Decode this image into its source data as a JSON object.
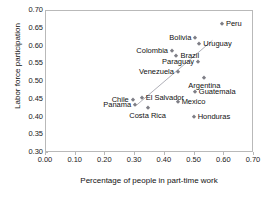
{
  "chart_data": {
    "type": "scatter",
    "title": "",
    "xlabel": "Percentage of people in part-time work",
    "ylabel": "Labor force participation",
    "xlim": [
      0.0,
      0.7
    ],
    "ylim": [
      0.3,
      0.7
    ],
    "xticks": [
      "0.00",
      "0.10",
      "0.20",
      "0.30",
      "0.40",
      "0.50",
      "0.60",
      "0.70"
    ],
    "xtick_values": [
      0.0,
      0.1,
      0.2,
      0.3,
      0.4,
      0.5,
      0.6,
      0.7
    ],
    "yticks": [
      "0.70",
      "0.65",
      "0.60",
      "0.55",
      "0.50",
      "0.45",
      "0.40",
      "0.35",
      "0.30"
    ],
    "ytick_values": [
      0.7,
      0.65,
      0.6,
      0.55,
      0.5,
      0.45,
      0.4,
      0.35,
      0.3
    ],
    "grid": false,
    "legend": "none",
    "marker_color": "#7e7e86",
    "marker_shape": "diamond",
    "trendline": {
      "visible": true,
      "color": "#b0b0b8",
      "x": [
        0.305,
        0.56
      ],
      "y": [
        0.435,
        0.617
      ]
    },
    "points": [
      {
        "label": "Peru",
        "x": 0.592,
        "y": 0.663,
        "label_pos": "right"
      },
      {
        "label": "Bolivia",
        "x": 0.503,
        "y": 0.625,
        "label_pos": "left"
      },
      {
        "label": "Uruguay",
        "x": 0.516,
        "y": 0.606,
        "label_pos": "right"
      },
      {
        "label": "Colombia",
        "x": 0.424,
        "y": 0.587,
        "label_pos": "left"
      },
      {
        "label": "Brazil",
        "x": 0.439,
        "y": 0.574,
        "label_pos": "right"
      },
      {
        "label": "Paraguay",
        "x": 0.512,
        "y": 0.556,
        "label_pos": "left"
      },
      {
        "label": "Venezuela",
        "x": 0.444,
        "y": 0.527,
        "label_pos": "left"
      },
      {
        "label": "Argentina",
        "x": 0.533,
        "y": 0.512,
        "label_pos": "below"
      },
      {
        "label": "Guatemala",
        "x": 0.501,
        "y": 0.471,
        "label_pos": "right"
      },
      {
        "label": "El Salvador",
        "x": 0.322,
        "y": 0.456,
        "label_pos": "right"
      },
      {
        "label": "Chile",
        "x": 0.292,
        "y": 0.45,
        "label_pos": "left"
      },
      {
        "label": "Mexico",
        "x": 0.443,
        "y": 0.444,
        "label_pos": "right"
      },
      {
        "label": "Panama",
        "x": 0.3,
        "y": 0.434,
        "label_pos": "left"
      },
      {
        "label": "Costa Rica",
        "x": 0.342,
        "y": 0.427,
        "label_pos": "below"
      },
      {
        "label": "Honduras",
        "x": 0.497,
        "y": 0.401,
        "label_pos": "right"
      }
    ]
  }
}
